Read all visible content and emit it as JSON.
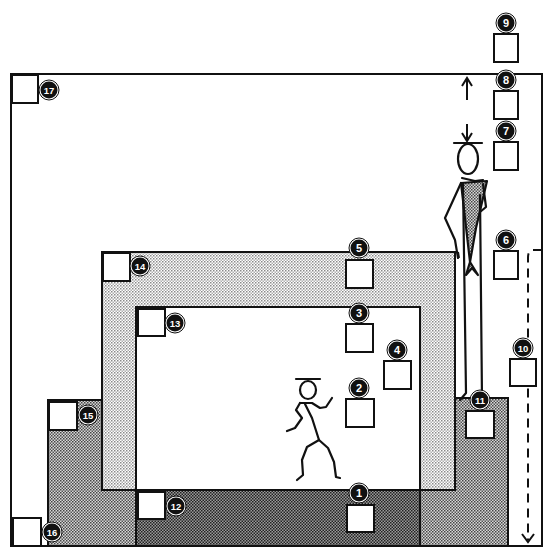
{
  "diagram": {
    "type": "stage-zone plan",
    "colors": {
      "line": "#111111",
      "light_dots": "#c8c8c8",
      "medium_dots": "#9a9a9a",
      "dark_dots": "#6e6e6e",
      "badge_fill": "#111111",
      "badge_text": "#ffffff"
    },
    "frame": {
      "x": 11,
      "y": 74,
      "w": 531,
      "h": 472
    },
    "markers": [
      {
        "id": "1",
        "label": "1",
        "square": {
          "x": 347,
          "y": 505,
          "w": 27,
          "h": 27
        },
        "badge": {
          "cx": 359,
          "cy": 493
        }
      },
      {
        "id": "2",
        "label": "2",
        "square": {
          "x": 346,
          "y": 399,
          "w": 28,
          "h": 28
        },
        "badge": {
          "cx": 359,
          "cy": 388
        }
      },
      {
        "id": "3",
        "label": "3",
        "square": {
          "x": 346,
          "y": 324,
          "w": 27,
          "h": 28
        },
        "badge": {
          "cx": 359,
          "cy": 313
        }
      },
      {
        "id": "4",
        "label": "4",
        "square": {
          "x": 384,
          "y": 361,
          "w": 27,
          "h": 28
        },
        "badge": {
          "cx": 397,
          "cy": 350
        }
      },
      {
        "id": "5",
        "label": "5",
        "square": {
          "x": 346,
          "y": 260,
          "w": 27,
          "h": 28
        },
        "badge": {
          "cx": 359,
          "cy": 248
        }
      },
      {
        "id": "6",
        "label": "6",
        "square": {
          "x": 494,
          "y": 251,
          "w": 24,
          "h": 28
        },
        "badge": {
          "cx": 506,
          "cy": 240
        }
      },
      {
        "id": "7",
        "label": "7",
        "square": {
          "x": 494,
          "y": 142,
          "w": 24,
          "h": 28
        },
        "badge": {
          "cx": 506,
          "cy": 131
        }
      },
      {
        "id": "8",
        "label": "8",
        "square": {
          "x": 494,
          "y": 91,
          "w": 24,
          "h": 28
        },
        "badge": {
          "cx": 506,
          "cy": 80
        }
      },
      {
        "id": "9",
        "label": "9",
        "square": {
          "x": 494,
          "y": 34,
          "w": 24,
          "h": 28
        },
        "badge": {
          "cx": 506,
          "cy": 23
        }
      },
      {
        "id": "10",
        "label": "10",
        "square": {
          "x": 510,
          "y": 359,
          "w": 26,
          "h": 27
        },
        "badge": {
          "cx": 523,
          "cy": 348
        }
      },
      {
        "id": "11",
        "label": "11",
        "square": {
          "x": 466,
          "y": 411,
          "w": 28,
          "h": 27
        },
        "badge": {
          "cx": 480,
          "cy": 400
        }
      },
      {
        "id": "12",
        "label": "12",
        "square": {
          "x": 138,
          "y": 492,
          "w": 27,
          "h": 27
        },
        "badge": {
          "cx": 176,
          "cy": 506
        }
      },
      {
        "id": "13",
        "label": "13",
        "square": {
          "x": 138,
          "y": 309,
          "w": 27,
          "h": 27
        },
        "badge": {
          "cx": 175,
          "cy": 323
        }
      },
      {
        "id": "14",
        "label": "14",
        "square": {
          "x": 103,
          "y": 253,
          "w": 27,
          "h": 28
        },
        "badge": {
          "cx": 140,
          "cy": 266
        }
      },
      {
        "id": "15",
        "label": "15",
        "square": {
          "x": 49,
          "y": 402,
          "w": 28,
          "h": 28
        },
        "badge": {
          "cx": 88,
          "cy": 415
        }
      },
      {
        "id": "16",
        "label": "16",
        "square": {
          "x": 13,
          "y": 518,
          "w": 28,
          "h": 28
        },
        "badge": {
          "cx": 52,
          "cy": 532
        }
      },
      {
        "id": "17",
        "label": "17",
        "square": {
          "x": 12,
          "y": 75,
          "w": 26,
          "h": 28
        },
        "badge": {
          "cx": 49,
          "cy": 90
        }
      }
    ],
    "figures": [
      {
        "name": "standing-figure",
        "description": "tall figure with hat leaning on wall, height arrows above"
      },
      {
        "name": "dancing-figure",
        "description": "figure in motion with hat inside inner white zone"
      }
    ]
  }
}
